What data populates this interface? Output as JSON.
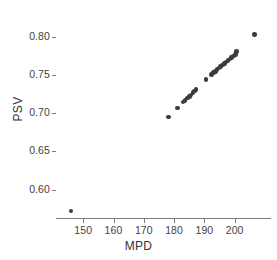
{
  "chart_data": {
    "type": "scatter",
    "title": "",
    "xlabel": "MPD",
    "ylabel": "PSV",
    "xlim": [
      141,
      212
    ],
    "ylim": [
      0.563,
      0.822
    ],
    "xticks": [
      150,
      160,
      170,
      180,
      190,
      200
    ],
    "xticklabels": [
      "150",
      "160",
      "170",
      "180",
      "190",
      "200"
    ],
    "yticks": [
      0.6,
      0.65,
      0.7,
      0.75,
      0.8
    ],
    "yticklabels": [
      "0.60",
      "0.65",
      "0.70",
      "0.75",
      "0.80"
    ],
    "grid": false,
    "legend": null,
    "marker": {
      "shape": "circle",
      "color": "#3b3b3b",
      "size_px": 4.6
    },
    "axes_style": {
      "spines": [
        "left",
        "bottom"
      ],
      "spine_color": "#7d7d7d",
      "background": "#ffffff",
      "tick_direction": "out"
    },
    "series": [
      {
        "name": "PSV vs MPD",
        "x": [
          146.0,
          178.2,
          181.2,
          183.0,
          183.6,
          184.4,
          185.0,
          185.6,
          186.2,
          186.7,
          187.2,
          190.6,
          192.4,
          193.0,
          193.6,
          194.2,
          194.8,
          195.4,
          196.0,
          196.6,
          197.2,
          197.8,
          198.4,
          199.0,
          199.6,
          200.2,
          200.7,
          206.5
        ],
        "y": [
          0.572,
          0.695,
          0.707,
          0.715,
          0.717,
          0.72,
          0.722,
          0.724,
          0.727,
          0.729,
          0.731,
          0.744,
          0.751,
          0.753,
          0.755,
          0.757,
          0.759,
          0.761,
          0.763,
          0.765,
          0.767,
          0.769,
          0.771,
          0.773,
          0.775,
          0.777,
          0.781,
          0.803
        ]
      }
    ],
    "n_points": 28
  }
}
